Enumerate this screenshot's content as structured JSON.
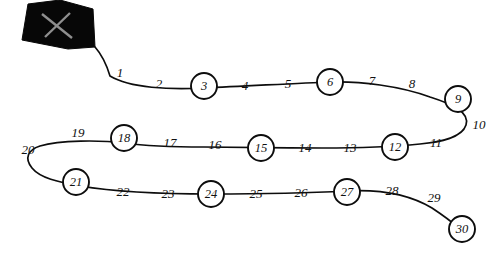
{
  "canvas": {
    "width": 486,
    "height": 255,
    "background_color": "#ffffff",
    "ink_color": "#0d0d0d"
  },
  "figure": {
    "kind": "serpentine-path-diagram",
    "shape": {
      "name": "kite-polygon",
      "fill_color": "#070707",
      "points": "28,4 22,40 68,49 95,47 93,9 60,0",
      "cross_lines": [
        {
          "x1": 42,
          "y1": 14,
          "x2": 72,
          "y2": 38
        },
        {
          "x1": 70,
          "y1": 13,
          "x2": 45,
          "y2": 37
        }
      ]
    },
    "path": {
      "stroke_color": "#0d0d0d",
      "stroke_width": 1.7,
      "d": "M 95,47 C 103,56 107,66 110,76 C 130,88 170,90 204,88 C 250,86 300,83 330,82 C 360,81 400,86 430,97 C 452,104 470,112 466,125 C 462,138 440,142 420,144 C 390,147 350,148 322,148 C 280,148 230,147 204,147 C 175,147 146,146 124,143 C 100,140 60,140 40,146 C 28,150 24,158 32,168 C 40,178 58,182 80,186 C 110,191 160,194 211,194 C 262,194 310,193 346,191 C 382,189 412,196 432,208 C 444,216 452,222 456,226"
    },
    "waypoints": [
      {
        "n": "1",
        "x": 120,
        "y": 73,
        "circled": false
      },
      {
        "n": "2",
        "x": 159,
        "y": 84,
        "circled": false
      },
      {
        "n": "3",
        "x": 204,
        "y": 86,
        "circled": true
      },
      {
        "n": "4",
        "x": 245,
        "y": 86,
        "circled": false
      },
      {
        "n": "5",
        "x": 288,
        "y": 84,
        "circled": false
      },
      {
        "n": "6",
        "x": 330,
        "y": 82,
        "circled": true
      },
      {
        "n": "7",
        "x": 372,
        "y": 81,
        "circled": false
      },
      {
        "n": "8",
        "x": 412,
        "y": 84,
        "circled": false
      },
      {
        "n": "9",
        "x": 458,
        "y": 99,
        "circled": true
      },
      {
        "n": "10",
        "x": 479,
        "y": 125,
        "circled": false
      },
      {
        "n": "11",
        "x": 436,
        "y": 143,
        "circled": false
      },
      {
        "n": "12",
        "x": 395,
        "y": 147,
        "circled": true
      },
      {
        "n": "13",
        "x": 350,
        "y": 148,
        "circled": false
      },
      {
        "n": "14",
        "x": 305,
        "y": 148,
        "circled": false
      },
      {
        "n": "15",
        "x": 261,
        "y": 148,
        "circled": true
      },
      {
        "n": "16",
        "x": 215,
        "y": 145,
        "circled": false
      },
      {
        "n": "17",
        "x": 170,
        "y": 143,
        "circled": false
      },
      {
        "n": "18",
        "x": 124,
        "y": 138,
        "circled": true
      },
      {
        "n": "19",
        "x": 78,
        "y": 133,
        "circled": false
      },
      {
        "n": "20",
        "x": 28,
        "y": 150,
        "circled": false
      },
      {
        "n": "21",
        "x": 76,
        "y": 182,
        "circled": true
      },
      {
        "n": "22",
        "x": 123,
        "y": 192,
        "circled": false
      },
      {
        "n": "23",
        "x": 168,
        "y": 194,
        "circled": false
      },
      {
        "n": "24",
        "x": 211,
        "y": 194,
        "circled": true
      },
      {
        "n": "25",
        "x": 256,
        "y": 194,
        "circled": false
      },
      {
        "n": "26",
        "x": 301,
        "y": 193,
        "circled": false
      },
      {
        "n": "27",
        "x": 347,
        "y": 192,
        "circled": true
      },
      {
        "n": "28",
        "x": 392,
        "y": 191,
        "circled": false
      },
      {
        "n": "29",
        "x": 434,
        "y": 198,
        "circled": false
      },
      {
        "n": "30",
        "x": 462,
        "y": 229,
        "circled": true
      }
    ],
    "marker_radius": 13
  }
}
